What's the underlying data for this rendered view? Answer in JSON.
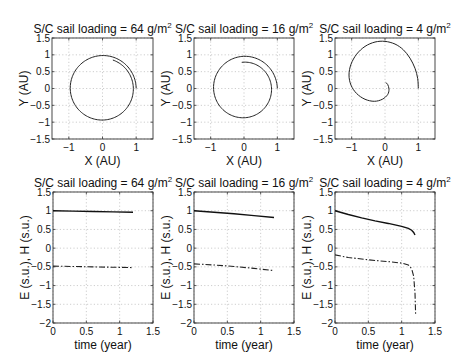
{
  "figure": {
    "panels_top": [
      {
        "title": "S/C sail loading = 64 g/m",
        "title_sup": "2",
        "xlabel": "X (AU)",
        "ylabel": "Y (AU)"
      },
      {
        "title": "S/C sail loading = 16 g/m",
        "title_sup": "2",
        "xlabel": "X (AU)",
        "ylabel": "Y (AU)"
      },
      {
        "title": "S/C sail loading =  4 g/m",
        "title_sup": "2",
        "xlabel": "X (AU)",
        "ylabel": "Y (AU)"
      }
    ],
    "panels_bottom": [
      {
        "title": "S/C sail loading = 64 g/m",
        "title_sup": "2",
        "xlabel": "time (year)",
        "ylabel": "E (s.u.), H (s.u.)"
      },
      {
        "title": "S/C sail loading = 16 g/m",
        "title_sup": "2",
        "xlabel": "time (year)",
        "ylabel": "E (s.u.), H (s.u.)"
      },
      {
        "title": "S/C sail loading =  4 g/m",
        "title_sup": "2",
        "xlabel": "time (year)",
        "ylabel": "E (s.u.), H (s.u.)"
      }
    ]
  },
  "chart_data": [
    {
      "type": "line",
      "title": "S/C sail loading = 64 g/m^2",
      "xlabel": "X (AU)",
      "ylabel": "Y (AU)",
      "xlim": [
        -1.5,
        1.5
      ],
      "ylim": [
        -1.5,
        1.5
      ],
      "xticks": [
        -1,
        0,
        1
      ],
      "yticks": [
        -1.5,
        -1,
        -0.5,
        0,
        0.5,
        1,
        1.5
      ],
      "grid": true,
      "series": [
        {
          "name": "trajectory",
          "style": "solid",
          "spiral": {
            "r0": 1.0,
            "r1": 0.9,
            "theta_end_deg": 430
          }
        }
      ]
    },
    {
      "type": "line",
      "title": "S/C sail loading = 16 g/m^2",
      "xlabel": "X (AU)",
      "ylabel": "Y (AU)",
      "xlim": [
        -1.5,
        1.5
      ],
      "ylim": [
        -1.5,
        1.5
      ],
      "xticks": [
        -1,
        0,
        1
      ],
      "yticks": [
        -1.5,
        -1,
        -0.5,
        0,
        0.5,
        1,
        1.5
      ],
      "grid": true,
      "series": [
        {
          "name": "trajectory",
          "style": "solid",
          "spiral": {
            "r0": 1.0,
            "r1": 0.78,
            "theta_end_deg": 455
          }
        }
      ]
    },
    {
      "type": "line",
      "title": "S/C sail loading = 4 g/m^2",
      "xlabel": "X (AU)",
      "ylabel": "Y (AU)",
      "xlim": [
        -1.5,
        1.5
      ],
      "ylim": [
        -1.5,
        1.5
      ],
      "xticks": [
        -1,
        0,
        1
      ],
      "yticks": [
        -1.5,
        -1,
        -0.5,
        0,
        0.5,
        1,
        1.5
      ],
      "grid": true,
      "series": [
        {
          "name": "trajectory",
          "style": "solid",
          "points": [
            [
              1.0,
              0.0
            ],
            [
              0.98,
              0.3
            ],
            [
              0.9,
              0.6
            ],
            [
              0.75,
              0.9
            ],
            [
              0.55,
              1.15
            ],
            [
              0.3,
              1.32
            ],
            [
              0.0,
              1.4
            ],
            [
              -0.3,
              1.38
            ],
            [
              -0.6,
              1.25
            ],
            [
              -0.85,
              1.02
            ],
            [
              -1.02,
              0.72
            ],
            [
              -1.08,
              0.4
            ],
            [
              -1.02,
              0.1
            ],
            [
              -0.85,
              -0.15
            ],
            [
              -0.6,
              -0.32
            ],
            [
              -0.32,
              -0.38
            ],
            [
              -0.08,
              -0.32
            ],
            [
              0.08,
              -0.18
            ],
            [
              0.12,
              -0.02
            ],
            [
              0.08,
              0.12
            ],
            [
              0.02,
              0.18
            ]
          ]
        }
      ]
    },
    {
      "type": "line",
      "title": "S/C sail loading = 64 g/m^2",
      "xlabel": "time (year)",
      "ylabel": "E (s.u.), H (s.u.)",
      "xlim": [
        0,
        1.5
      ],
      "ylim": [
        -2,
        1.5
      ],
      "xticks": [
        0,
        0.5,
        1,
        1.5
      ],
      "yticks": [
        -2,
        -1.5,
        -1,
        -0.5,
        0,
        0.5,
        1,
        1.5
      ],
      "grid": true,
      "series": [
        {
          "name": "E",
          "style": "solid",
          "x": [
            0,
            0.3,
            0.6,
            0.9,
            1.2
          ],
          "y": [
            1.0,
            0.99,
            0.98,
            0.97,
            0.96
          ]
        },
        {
          "name": "H",
          "style": "dashdot",
          "x": [
            0,
            0.3,
            0.6,
            0.9,
            1.2
          ],
          "y": [
            -0.48,
            -0.49,
            -0.5,
            -0.51,
            -0.52
          ]
        }
      ]
    },
    {
      "type": "line",
      "title": "S/C sail loading = 16 g/m^2",
      "xlabel": "time (year)",
      "ylabel": "E (s.u.), H (s.u.)",
      "xlim": [
        0,
        1.5
      ],
      "ylim": [
        -2,
        1.5
      ],
      "xticks": [
        0,
        0.5,
        1,
        1.5
      ],
      "yticks": [
        -2,
        -1.5,
        -1,
        -0.5,
        0,
        0.5,
        1,
        1.5
      ],
      "grid": true,
      "series": [
        {
          "name": "E",
          "style": "solid",
          "x": [
            0,
            0.3,
            0.6,
            0.9,
            1.2
          ],
          "y": [
            1.0,
            0.96,
            0.92,
            0.87,
            0.82
          ]
        },
        {
          "name": "H",
          "style": "dashdot",
          "x": [
            0,
            0.3,
            0.6,
            0.9,
            1.2
          ],
          "y": [
            -0.42,
            -0.45,
            -0.49,
            -0.54,
            -0.6
          ]
        }
      ]
    },
    {
      "type": "line",
      "title": "S/C sail loading = 4 g/m^2",
      "xlabel": "time (year)",
      "ylabel": "E (s.u.), H (s.u.)",
      "xlim": [
        0,
        1.5
      ],
      "ylim": [
        -2,
        1.5
      ],
      "xticks": [
        0,
        0.5,
        1,
        1.5
      ],
      "yticks": [
        -2,
        -1.5,
        -1,
        -0.5,
        0,
        0.5,
        1,
        1.5
      ],
      "grid": true,
      "series": [
        {
          "name": "E",
          "style": "solid",
          "x": [
            0,
            0.2,
            0.4,
            0.6,
            0.8,
            1.0,
            1.1,
            1.15,
            1.18,
            1.2
          ],
          "y": [
            1.0,
            0.9,
            0.81,
            0.73,
            0.66,
            0.58,
            0.53,
            0.48,
            0.42,
            0.35
          ]
        },
        {
          "name": "H",
          "style": "dashdot",
          "x": [
            0,
            0.2,
            0.4,
            0.6,
            0.8,
            1.0,
            1.1,
            1.15,
            1.18,
            1.2,
            1.21
          ],
          "y": [
            -0.18,
            -0.25,
            -0.29,
            -0.33,
            -0.36,
            -0.4,
            -0.45,
            -0.55,
            -0.75,
            -1.2,
            -1.8
          ]
        }
      ]
    }
  ]
}
